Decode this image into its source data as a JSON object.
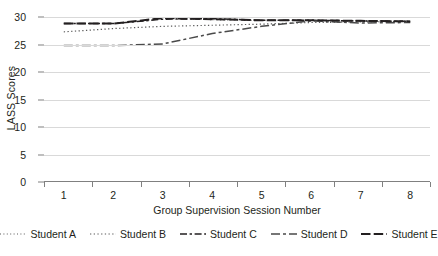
{
  "chart_data": {
    "type": "line",
    "title": "",
    "xlabel": "Group Supervision Session Number",
    "ylabel": "LASS Scores",
    "x": [
      1,
      2,
      3,
      4,
      5,
      6,
      7,
      8
    ],
    "categories": [
      "1",
      "2",
      "3",
      "4",
      "5",
      "6",
      "7",
      "8"
    ],
    "xlim": [
      0.6,
      8.4
    ],
    "ylim": [
      0,
      30
    ],
    "yticks": [
      0,
      5,
      10,
      15,
      20,
      25,
      30
    ],
    "ytick_labels": [
      "0",
      "5",
      "10",
      "15",
      "20",
      "25",
      "30"
    ],
    "grid": true,
    "legend_position": "bottom",
    "series": [
      {
        "name": "Student A",
        "values": [
          30.0,
          30.0,
          29.9,
          29.5,
          29.4,
          29.4,
          29.3,
          29.2
        ],
        "line_style": "fine-dotted",
        "color": "#5a5a5a"
      },
      {
        "name": "Student B",
        "values": [
          27.3,
          27.9,
          28.3,
          28.5,
          28.7,
          29.0,
          29.1,
          29.2
        ],
        "line_style": "dotted",
        "color": "#5a5a5a"
      },
      {
        "name": "Student C",
        "values": [
          28.8,
          28.8,
          29.6,
          29.7,
          29.4,
          29.4,
          29.3,
          29.2
        ],
        "line_style": "dash-dot",
        "color": "#231f20"
      },
      {
        "name": "Student D",
        "values": [
          24.8,
          24.8,
          25.1,
          27.0,
          28.3,
          29.3,
          28.9,
          29.0
        ],
        "line_style": "long-dash-dot",
        "color": "#4a4a4a"
      },
      {
        "name": "Student E",
        "values": [
          28.8,
          28.8,
          29.8,
          29.6,
          29.4,
          29.4,
          29.3,
          29.2
        ],
        "line_style": "long-dash",
        "color": "#231f20"
      }
    ]
  },
  "axes": {
    "y_title": "LASS Scores",
    "x_title": "Group Supervision Session Number",
    "y_tick_labels": [
      "30",
      "25",
      "20",
      "15",
      "10",
      "5",
      "0"
    ],
    "x_tick_labels": [
      "1",
      "2",
      "3",
      "4",
      "5",
      "6",
      "7",
      "8"
    ]
  },
  "legend": {
    "items": [
      {
        "label": "Student A"
      },
      {
        "label": "Student B"
      },
      {
        "label": "Student C"
      },
      {
        "label": "Student D"
      },
      {
        "label": "Student E"
      }
    ]
  }
}
